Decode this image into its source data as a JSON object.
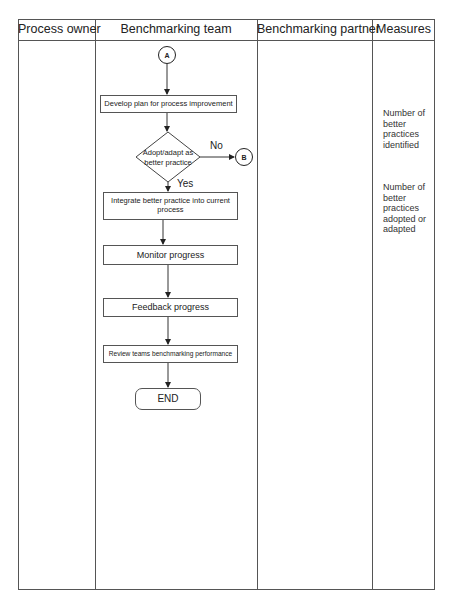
{
  "columns": [
    {
      "label": "Process owner"
    },
    {
      "label": "Benchmarking team"
    },
    {
      "label": "Benchmarking partner"
    },
    {
      "label": "Measures"
    }
  ],
  "flow": {
    "start_connector": "A",
    "steps": [
      "Develop plan for process improvement",
      "Integrate better practice into current process",
      "Monitor progress",
      "Feedback progress",
      "Review teams benchmarking performance"
    ],
    "decision": {
      "line1": "Adopt/adapt as",
      "line2": "better practice",
      "no_label": "No",
      "yes_label": "Yes",
      "no_connector": "B"
    },
    "end_label": "END"
  },
  "measures": [
    "Number of better practices identified",
    "Number of better practices adopted or adapted"
  ],
  "colors": {
    "line": "#555555",
    "text": "#222222",
    "background": "#ffffff"
  }
}
